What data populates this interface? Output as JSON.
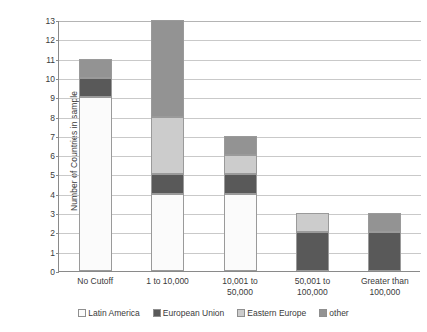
{
  "chart_data": {
    "type": "bar",
    "title": "",
    "subtitle": "",
    "xlabel": "",
    "ylabel": "Number of Countries in sample",
    "ylim": [
      0,
      13
    ],
    "ytick_values": [
      0,
      1,
      2,
      3,
      4,
      5,
      6,
      7,
      8,
      9,
      10,
      11,
      12,
      13
    ],
    "ytick_labels": [
      "0",
      "1",
      "2",
      "3",
      "4",
      "5",
      "6",
      "7",
      "8",
      "9",
      "10",
      "11",
      "12",
      "13"
    ],
    "grid": true,
    "stacked": true,
    "legend_position": "bottom",
    "categories": [
      "No Cutoff",
      "1 to 10,000",
      "10,001 to\n50,000",
      "50,001 to\n100,000",
      "Greater than\n100,000"
    ],
    "series": [
      {
        "name": "Latin America",
        "color": "#fbfbfb",
        "values": [
          9,
          4,
          4,
          0,
          0
        ]
      },
      {
        "name": "European Union",
        "color": "#595959",
        "values": [
          1,
          1,
          1,
          2,
          2
        ]
      },
      {
        "name": "Eastern Europe",
        "color": "#cccccc",
        "values": [
          0,
          3,
          1,
          1,
          0
        ]
      },
      {
        "name": "other",
        "color": "#939393",
        "values": [
          1,
          5,
          1,
          0,
          1
        ]
      }
    ],
    "totals": [
      11,
      13,
      7,
      3,
      3
    ]
  },
  "legend": {
    "items": [
      {
        "label": "Latin America"
      },
      {
        "label": "European Union"
      },
      {
        "label": "Eastern Europe"
      },
      {
        "label": "other"
      }
    ]
  }
}
